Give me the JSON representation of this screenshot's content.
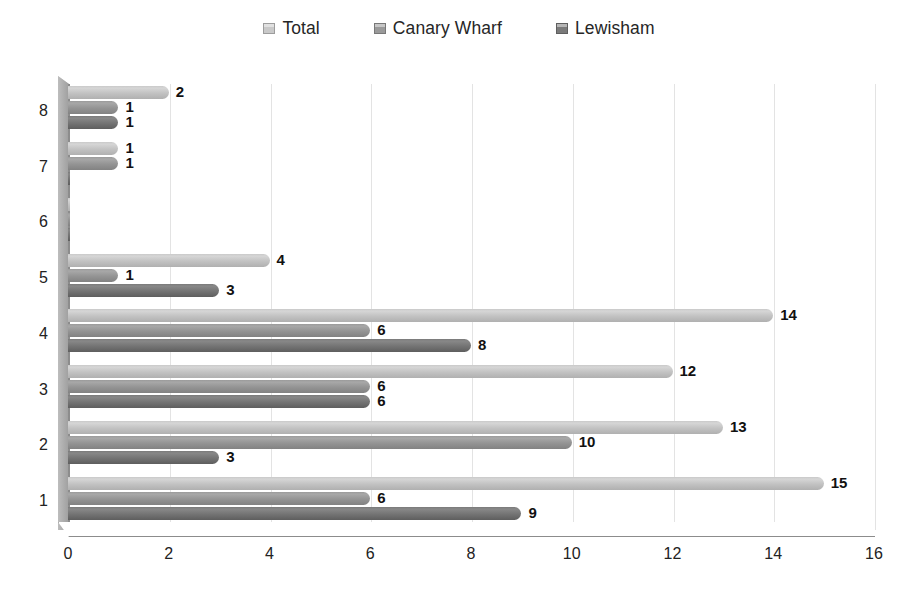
{
  "chart_data": {
    "type": "bar",
    "orientation": "horizontal",
    "title": "",
    "subtitle": "",
    "xlabel": "",
    "ylabel": "",
    "xlim": [
      0,
      16
    ],
    "xticks": [
      0,
      2,
      4,
      6,
      8,
      10,
      12,
      14,
      16
    ],
    "categories": [
      "1",
      "2",
      "3",
      "4",
      "5",
      "6",
      "7",
      "8"
    ],
    "category_order_top_to_bottom": [
      "8",
      "7",
      "6",
      "5",
      "4",
      "3",
      "2",
      "1"
    ],
    "grid": "vertical",
    "legend_position": "top-center",
    "style": "3d-clustered-bar",
    "series": [
      {
        "name": "Total",
        "color": "#c9c9c9",
        "values": [
          15,
          13,
          12,
          14,
          4,
          0,
          1,
          2
        ],
        "labels": [
          "15",
          "13",
          "12",
          "14",
          "4",
          "",
          "1",
          "2"
        ]
      },
      {
        "name": "Canary Wharf",
        "color": "#9a9a9a",
        "values": [
          6,
          10,
          6,
          6,
          1,
          0,
          1,
          1
        ],
        "labels": [
          "6",
          "10",
          "6",
          "6",
          "1",
          "",
          "1",
          "1"
        ]
      },
      {
        "name": "Lewisham",
        "color": "#7a7a7a",
        "values": [
          9,
          3,
          6,
          8,
          3,
          0,
          0,
          1
        ],
        "labels": [
          "9",
          "3",
          "6",
          "8",
          "3",
          "",
          "",
          "1"
        ]
      }
    ]
  },
  "legend": {
    "entries": [
      {
        "label": "Total",
        "color": "#c9c9c9"
      },
      {
        "label": "Canary Wharf",
        "color": "#9a9a9a"
      },
      {
        "label": "Lewisham",
        "color": "#7a7a7a"
      }
    ]
  },
  "axes": {
    "x_tick_labels": [
      "0",
      "2",
      "4",
      "6",
      "8",
      "10",
      "12",
      "14",
      "16"
    ],
    "y_tick_labels": [
      "8",
      "7",
      "6",
      "5",
      "4",
      "3",
      "2",
      "1"
    ]
  }
}
